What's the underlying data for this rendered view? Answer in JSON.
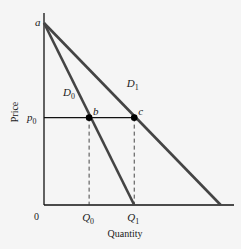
{
  "chart_data": {
    "type": "line",
    "title": "",
    "xlabel": "Quantity",
    "ylabel": "Price",
    "xlim": [
      0,
      100
    ],
    "ylim": [
      0,
      100
    ],
    "grid": false,
    "origin_label": "0",
    "series": [
      {
        "name": "D0",
        "label_main": "D",
        "label_sub": "0",
        "x": [
          0,
          48
        ],
        "y": [
          100,
          0
        ]
      },
      {
        "name": "D1",
        "label_main": "D",
        "label_sub": "1",
        "x": [
          0,
          94
        ],
        "y": [
          100,
          0
        ]
      }
    ],
    "price_level": {
      "label_main": "p",
      "label_sub": "0",
      "value": 48
    },
    "points": [
      {
        "name": "a",
        "label": "a",
        "x": 0,
        "y": 100,
        "marker": false
      },
      {
        "name": "b",
        "label": "b",
        "x": 24,
        "y": 48,
        "marker": true
      },
      {
        "name": "c",
        "label": "c",
        "x": 48,
        "y": 48,
        "marker": true
      }
    ],
    "quantity_ticks": [
      {
        "name": "Q0",
        "label_main": "Q",
        "label_sub": "0",
        "x": 24
      },
      {
        "name": "Q1",
        "label_main": "Q",
        "label_sub": "1",
        "x": 48
      }
    ]
  }
}
